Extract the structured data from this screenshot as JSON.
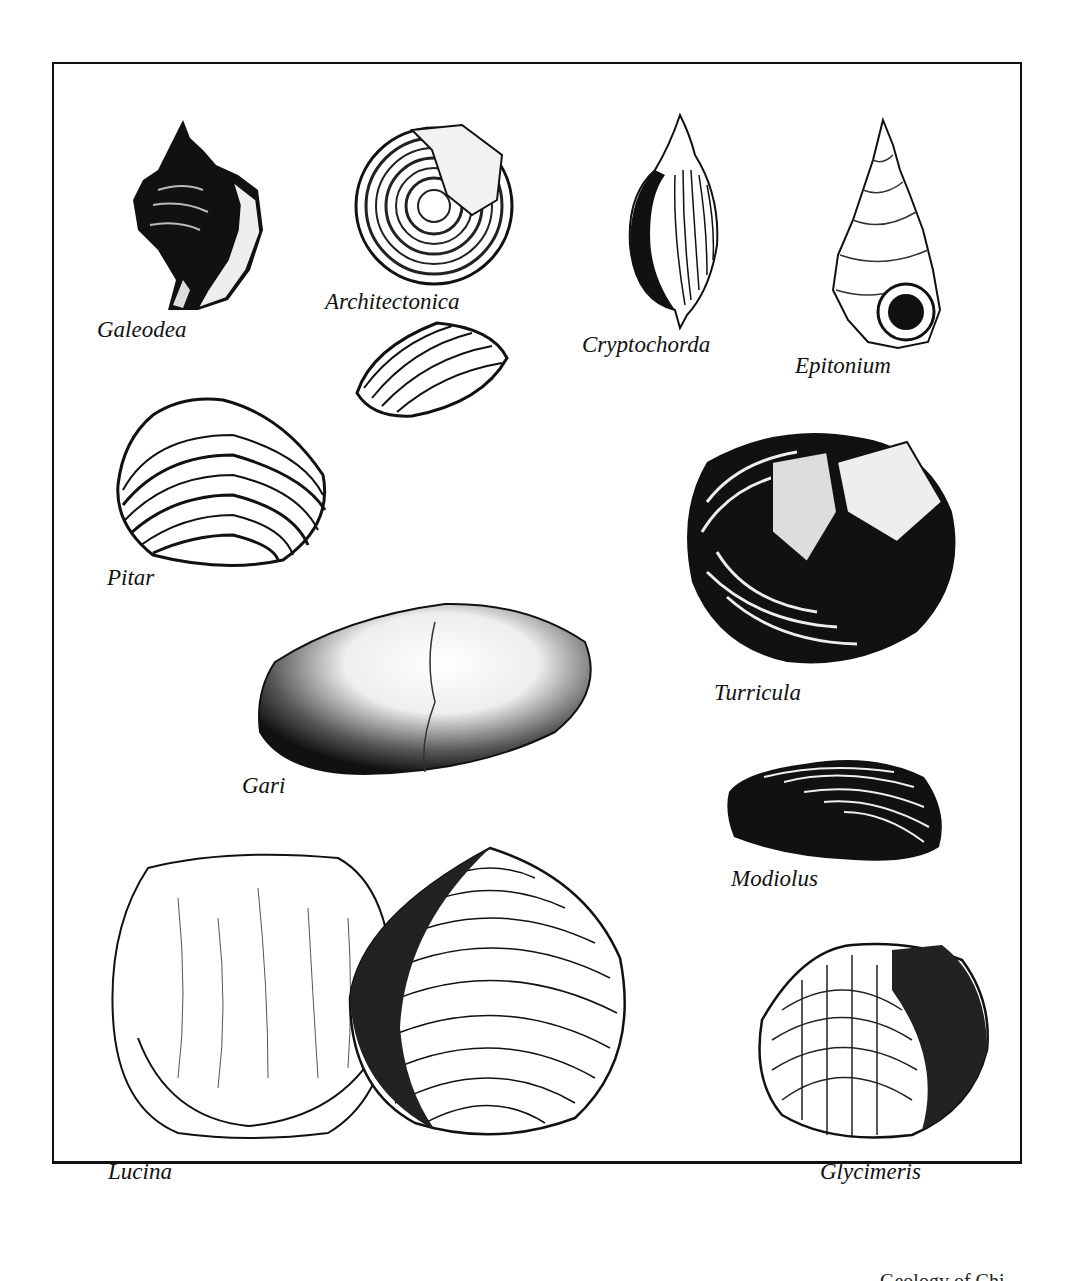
{
  "plate": {
    "specimens": [
      {
        "id": "galeodea",
        "label": "Galeodea",
        "type": "gastropod"
      },
      {
        "id": "architectonica",
        "label": "Architectonica",
        "type": "gastropod"
      },
      {
        "id": "cryptochorda",
        "label": "Cryptochorda",
        "type": "gastropod"
      },
      {
        "id": "epitonium",
        "label": "Epitonium",
        "type": "gastropod"
      },
      {
        "id": "pitar",
        "label": "Pitar",
        "type": "bivalve"
      },
      {
        "id": "turricula",
        "label": "Turricula",
        "type": "gastropod"
      },
      {
        "id": "gari",
        "label": "Gari",
        "type": "bivalve"
      },
      {
        "id": "modiolus",
        "label": "Modiolus",
        "type": "bivalve"
      },
      {
        "id": "lucina",
        "label": "Lucina",
        "type": "bivalve"
      },
      {
        "id": "glycimeris",
        "label": "Glycimeris",
        "type": "bivalve"
      }
    ]
  },
  "footer": {
    "partial_text": "Geology of Chi"
  }
}
